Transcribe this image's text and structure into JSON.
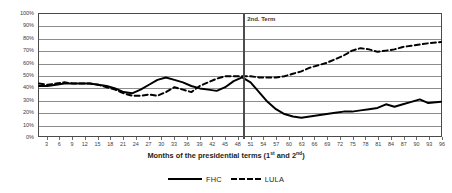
{
  "chart_data": {
    "type": "line",
    "title": "",
    "xlabel": "Months of the presidential terms (1st and 2nd)",
    "xlabel_parts": {
      "a": "Months of the  presidential terms (1",
      "sup1": "st",
      "b": " and 2",
      "sup2": "nd",
      "c": ")"
    },
    "ylabel": "",
    "ylim": [
      0,
      100
    ],
    "xlim": [
      1,
      96
    ],
    "grid": true,
    "legend_position": "bottom",
    "y_ticks": [
      "0%",
      "10%",
      "20%",
      "30%",
      "40%",
      "50%",
      "60%",
      "70%",
      "80%",
      "90%",
      "100%"
    ],
    "y_tick_values": [
      0,
      10,
      20,
      30,
      40,
      50,
      60,
      70,
      80,
      90,
      100
    ],
    "x_ticks": [
      3,
      6,
      9,
      12,
      15,
      18,
      21,
      24,
      27,
      30,
      33,
      36,
      39,
      42,
      45,
      48,
      51,
      54,
      57,
      60,
      63,
      66,
      69,
      72,
      75,
      78,
      81,
      84,
      87,
      90,
      93,
      96
    ],
    "annotations": [
      {
        "name": "second-term-divider",
        "label": "2nd. Term",
        "x": 49,
        "type": "vline"
      }
    ],
    "series": [
      {
        "name": "FHC",
        "style": "solid",
        "color": "#000000",
        "x": [
          1,
          3,
          5,
          7,
          9,
          11,
          13,
          15,
          17,
          19,
          21,
          23,
          25,
          27,
          29,
          31,
          33,
          35,
          37,
          39,
          41,
          43,
          45,
          47,
          49,
          51,
          53,
          55,
          57,
          59,
          61,
          63,
          65,
          67,
          69,
          71,
          73,
          75,
          77,
          79,
          81,
          83,
          85,
          87,
          89,
          91,
          93,
          96
        ],
        "values": [
          41,
          41,
          42,
          43,
          43,
          43,
          43,
          42,
          41,
          39,
          36,
          35,
          38,
          42,
          46,
          48,
          46,
          44,
          41,
          39,
          38,
          37,
          40,
          45,
          48,
          44,
          36,
          28,
          22,
          18,
          16,
          15,
          16,
          17,
          18,
          19,
          20,
          20,
          21,
          22,
          23,
          26,
          24,
          26,
          28,
          30,
          27,
          28
        ]
      },
      {
        "name": "LULA",
        "style": "dashed",
        "color": "#000000",
        "x": [
          1,
          3,
          5,
          7,
          9,
          11,
          13,
          15,
          17,
          19,
          21,
          23,
          25,
          27,
          29,
          31,
          33,
          35,
          37,
          39,
          41,
          43,
          45,
          47,
          49,
          51,
          53,
          55,
          57,
          59,
          61,
          63,
          65,
          67,
          69,
          71,
          73,
          75,
          77,
          79,
          81,
          83,
          85,
          87,
          89,
          91,
          93,
          96
        ],
        "values": [
          43,
          42,
          43,
          44,
          43,
          43,
          43,
          42,
          40,
          38,
          35,
          33,
          33,
          34,
          33,
          36,
          40,
          38,
          36,
          41,
          44,
          47,
          49,
          49,
          49,
          49,
          48,
          48,
          48,
          49,
          51,
          53,
          56,
          58,
          60,
          63,
          66,
          70,
          72,
          71,
          69,
          70,
          71,
          73,
          74,
          75,
          76,
          77
        ]
      }
    ]
  },
  "legend": {
    "items": [
      {
        "label": "FHC",
        "style": "solid"
      },
      {
        "label": "LULA",
        "style": "dashed"
      }
    ]
  }
}
